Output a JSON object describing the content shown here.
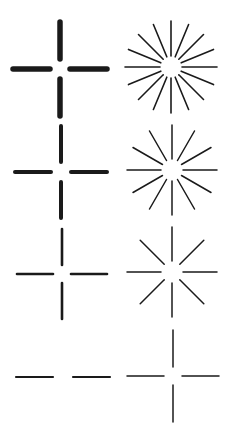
{
  "diagram": {
    "ink_color": "#1a1a1a",
    "background": "#ffffff",
    "layout": {
      "rows": 4,
      "columns": 2
    },
    "crosses": [
      {
        "id": "cross-1",
        "cx": 60,
        "cy": 69,
        "inner_gap": 10,
        "arm_length": 37,
        "thickness": 5.5,
        "arms": [
          "up",
          "down",
          "left",
          "right"
        ]
      },
      {
        "id": "cross-2",
        "cx": 61,
        "cy": 172,
        "inner_gap": 10,
        "arm_length": 36,
        "thickness": 4,
        "arms": [
          "up",
          "down",
          "left",
          "right"
        ]
      },
      {
        "id": "cross-3",
        "cx": 62,
        "cy": 274,
        "inner_gap": 9,
        "arm_length": 36,
        "thickness": 2.6,
        "arms": [
          "up",
          "down",
          "left",
          "right"
        ]
      },
      {
        "id": "cross-4",
        "cx": 63,
        "cy": 377,
        "inner_gap": 10,
        "arm_length": 37,
        "thickness": 2.2,
        "arms": [
          "left",
          "right"
        ]
      }
    ],
    "starbursts": [
      {
        "id": "star-1",
        "cx": 171,
        "cy": 67,
        "inner_radius": 11,
        "outer_radius": 46,
        "rays": 16,
        "thickness": 1.6
      },
      {
        "id": "star-2",
        "cx": 172,
        "cy": 170,
        "inner_radius": 11,
        "outer_radius": 45,
        "rays": 12,
        "thickness": 1.5
      },
      {
        "id": "star-3",
        "cx": 172,
        "cy": 272,
        "inner_radius": 11,
        "outer_radius": 45,
        "rays": 8,
        "thickness": 1.5
      },
      {
        "id": "star-4",
        "cx": 173,
        "cy": 376,
        "inner_radius": 9,
        "outer_radius": 46,
        "rays": 4,
        "thickness": 1.5
      }
    ]
  }
}
